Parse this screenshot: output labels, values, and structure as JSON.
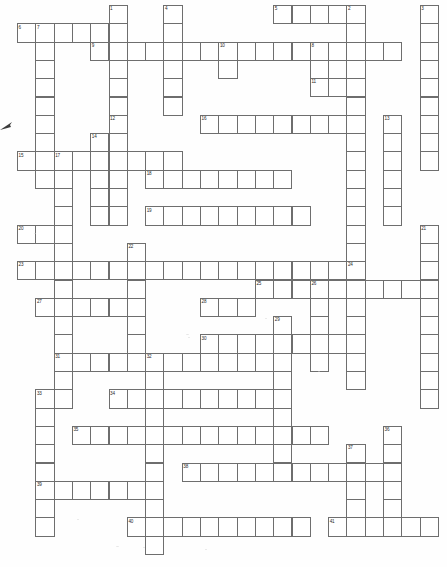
{
  "document": {
    "type": "crossword-puzzle-grid",
    "title": "Crossword Puzzle",
    "description": "Blank scanned crossword puzzle grid with numbered entry squares",
    "columns": 23,
    "rows": 30,
    "cell_size_px": 18.3,
    "origin_x_px": 17,
    "origin_y_px": 5,
    "cell_fill_color": "#ffffff",
    "cell_border_color": "#6e6e6e",
    "number_color": "#2a2a2a",
    "page_background_color": "#fefefe",
    "highest_clue_number": 41
  },
  "entries": [
    {
      "number": 1,
      "direction": "down",
      "row": 0,
      "col": 5,
      "length": 8
    },
    {
      "number": 2,
      "direction": "down",
      "row": 0,
      "col": 18,
      "length": 19
    },
    {
      "number": 3,
      "direction": "down",
      "row": 0,
      "col": 22,
      "length": 9
    },
    {
      "number": 4,
      "direction": "down",
      "row": 0,
      "col": 8,
      "length": 6
    },
    {
      "number": 5,
      "direction": "across",
      "row": 0,
      "col": 14,
      "length": 5
    },
    {
      "number": 6,
      "direction": "across",
      "row": 1,
      "col": 0,
      "length": 5
    },
    {
      "number": 7,
      "direction": "down",
      "row": 1,
      "col": 1,
      "length": 9
    },
    {
      "number": 8,
      "direction": "down",
      "row": 2,
      "col": 16,
      "length": 3
    },
    {
      "number": 9,
      "direction": "across",
      "row": 2,
      "col": 4,
      "length": 17
    },
    {
      "number": 10,
      "direction": "down",
      "row": 2,
      "col": 11,
      "length": 2
    },
    {
      "number": 11,
      "direction": "across",
      "row": 4,
      "col": 16,
      "length": 2
    },
    {
      "number": 12,
      "direction": "down",
      "row": 6,
      "col": 5,
      "length": 6
    },
    {
      "number": 13,
      "direction": "down",
      "row": 6,
      "col": 20,
      "length": 6
    },
    {
      "number": 14,
      "direction": "down",
      "row": 7,
      "col": 4,
      "length": 5
    },
    {
      "number": 15,
      "direction": "across",
      "row": 8,
      "col": 0,
      "length": 9
    },
    {
      "number": 16,
      "direction": "across",
      "row": 6,
      "col": 10,
      "length": 9
    },
    {
      "number": 17,
      "direction": "down",
      "row": 8,
      "col": 2,
      "length": 14
    },
    {
      "number": 18,
      "direction": "across",
      "row": 9,
      "col": 7,
      "length": 8
    },
    {
      "number": 19,
      "direction": "across",
      "row": 11,
      "col": 7,
      "length": 9
    },
    {
      "number": 20,
      "direction": "across",
      "row": 12,
      "col": 0,
      "length": 2
    },
    {
      "number": 21,
      "direction": "down",
      "row": 12,
      "col": 22,
      "length": 10
    },
    {
      "number": 22,
      "direction": "down",
      "row": 13,
      "col": 6,
      "length": 6
    },
    {
      "number": 23,
      "direction": "across",
      "row": 14,
      "col": 0,
      "length": 19
    },
    {
      "number": 24,
      "direction": "down",
      "row": 14,
      "col": 18,
      "length": 7
    },
    {
      "number": 25,
      "direction": "across",
      "row": 15,
      "col": 13,
      "length": 9
    },
    {
      "number": 26,
      "direction": "down",
      "row": 15,
      "col": 16,
      "length": 5
    },
    {
      "number": 27,
      "direction": "across",
      "row": 16,
      "col": 1,
      "length": 6
    },
    {
      "number": 28,
      "direction": "across",
      "row": 16,
      "col": 10,
      "length": 3
    },
    {
      "number": 29,
      "direction": "down",
      "row": 17,
      "col": 14,
      "length": 8
    },
    {
      "number": 30,
      "direction": "across",
      "row": 18,
      "col": 10,
      "length": 8
    },
    {
      "number": 31,
      "direction": "across",
      "row": 19,
      "col": 2,
      "length": 13
    },
    {
      "number": 32,
      "direction": "down",
      "row": 19,
      "col": 7,
      "length": 11
    },
    {
      "number": 33,
      "direction": "down",
      "row": 21,
      "col": 1,
      "length": 8
    },
    {
      "number": 34,
      "direction": "across",
      "row": 21,
      "col": 5,
      "length": 9
    },
    {
      "number": 35,
      "direction": "across",
      "row": 23,
      "col": 3,
      "length": 14
    },
    {
      "number": 36,
      "direction": "down",
      "row": 23,
      "col": 20,
      "length": 5
    },
    {
      "number": 37,
      "direction": "down",
      "row": 24,
      "col": 18,
      "length": 4
    },
    {
      "number": 38,
      "direction": "across",
      "row": 25,
      "col": 9,
      "length": 12
    },
    {
      "number": 39,
      "direction": "across",
      "row": 26,
      "col": 1,
      "length": 7
    },
    {
      "number": 40,
      "direction": "across",
      "row": 28,
      "col": 6,
      "length": 10
    },
    {
      "number": 41,
      "direction": "across",
      "row": 28,
      "col": 17,
      "length": 6
    }
  ]
}
